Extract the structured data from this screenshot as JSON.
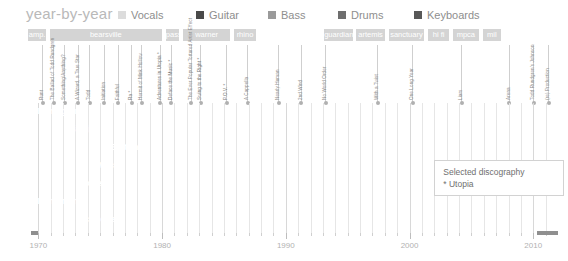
{
  "header": {
    "title": "year-by-year",
    "legend": [
      {
        "label": "Vocals",
        "color": "#dcdcdc"
      },
      {
        "label": "Guitar",
        "color": "#4a4a4a"
      },
      {
        "label": "Bass",
        "color": "#9a9a9a"
      },
      {
        "label": "Drums",
        "color": "#6e6e6e"
      },
      {
        "label": "Keyboards",
        "color": "#585858"
      }
    ]
  },
  "annotation": {
    "line1": "Selected discography",
    "line2": "* Utopia"
  },
  "chart_data": {
    "type": "bar",
    "title": "year-by-year",
    "xlabel": "",
    "ylabel": "",
    "xlim": [
      1969.0,
      2012.0
    ],
    "grid": true,
    "legend_position": "top",
    "tick_labels": [
      "1970",
      "1980",
      "1990",
      "2000",
      "2010"
    ],
    "tick_years": [
      1970,
      1980,
      1990,
      2000,
      2010
    ],
    "record_labels": [
      {
        "name": "amp.",
        "start": 1969.2,
        "end": 1970.6
      },
      {
        "name": "bearsville",
        "start": 1970.9,
        "end": 1980.0
      },
      {
        "name": "pass",
        "start": 1980.3,
        "end": 1981.4
      },
      {
        "name": "warner",
        "start": 1981.7,
        "end": 1985.5
      },
      {
        "name": "rhino",
        "start": 1985.8,
        "end": 1987.6
      },
      {
        "name": "guardian",
        "start": 1993.1,
        "end": 1995.4
      },
      {
        "name": "artemis",
        "start": 1995.7,
        "end": 1998.0
      },
      {
        "name": "sanctuary",
        "start": 1998.3,
        "end": 2001.2
      },
      {
        "name": "hi fi",
        "start": 2001.5,
        "end": 2003.2
      },
      {
        "name": "mpca",
        "start": 2003.5,
        "end": 2005.6
      },
      {
        "name": "mil",
        "start": 2005.9,
        "end": 2007.4
      }
    ],
    "albums": [
      {
        "title": "Runt",
        "year": 1970.3,
        "utopia": false
      },
      {
        "title": "The Ballad of Todd Rundgren",
        "year": 1971.2,
        "utopia": false
      },
      {
        "title": "Something/Anything?",
        "year": 1972.1,
        "utopia": false
      },
      {
        "title": "A Wizard, a True Star",
        "year": 1973.2,
        "utopia": false
      },
      {
        "title": "Todd",
        "year": 1974.1,
        "utopia": false
      },
      {
        "title": "Initiation",
        "year": 1975.3,
        "utopia": false
      },
      {
        "title": "Faithful",
        "year": 1976.4,
        "utopia": false
      },
      {
        "title": "Ra *",
        "year": 1977.5,
        "utopia": true
      },
      {
        "title": "Hermit of Mink Hollow",
        "year": 1978.3,
        "utopia": false
      },
      {
        "title": "Adventures in Utopia *",
        "year": 1979.8,
        "utopia": true
      },
      {
        "title": "Deface the Music *",
        "year": 1980.7,
        "utopia": true
      },
      {
        "title": "The Ever Popular Tortured Artist Effect",
        "year": 1982.3,
        "utopia": false
      },
      {
        "title": "Swing to the Right *",
        "year": 1983.1,
        "utopia": true
      },
      {
        "title": "P.O.V. *",
        "year": 1985.2,
        "utopia": true
      },
      {
        "title": "A Cappella",
        "year": 1986.9,
        "utopia": false
      },
      {
        "title": "Nearly Human",
        "year": 1989.4,
        "utopia": false
      },
      {
        "title": "2nd Wind",
        "year": 1991.2,
        "utopia": false
      },
      {
        "title": "No World Order",
        "year": 1993.2,
        "utopia": false
      },
      {
        "title": "With a Twist",
        "year": 1997.4,
        "utopia": false
      },
      {
        "title": "One Long Year",
        "year": 2000.2,
        "utopia": false
      },
      {
        "title": "Liars",
        "year": 2004.2,
        "utopia": false
      },
      {
        "title": "Arena",
        "year": 2008.0,
        "utopia": false
      },
      {
        "title": "Todd Rundgren's Johnson",
        "year": 2010.0,
        "utopia": false
      },
      {
        "title": "(re) Production",
        "year": 2011.2,
        "utopia": false
      }
    ],
    "members": [
      {
        "name": "Rundgren",
        "label_end": 1973.0,
        "segments": [
          {
            "start": 1969.6,
            "end": 2012.0,
            "color": "#6b6b6b",
            "style": "solid"
          }
        ]
      },
      {
        "name": "Siegler",
        "label_start": 1972.2,
        "label_end": 1975.6,
        "segments": [
          {
            "start": 1972.2,
            "end": 1975.6,
            "color": "#9a9a9a",
            "style": "solid"
          },
          {
            "start": 1975.6,
            "end": 2010.3,
            "color": "#9a9a9a",
            "style": "hatch"
          },
          {
            "start": 2010.3,
            "end": 2012.0,
            "color": "#9a9a9a",
            "style": "solid"
          }
        ]
      },
      {
        "name": "Sulton",
        "label_start": 1975.5,
        "label_end": 1978.2,
        "segments": [
          {
            "start": 1975.5,
            "end": 1986.0,
            "color": "#8a8a8a",
            "style": "solid"
          },
          {
            "start": 1986.0,
            "end": 1988.4,
            "color": "#8a8a8a",
            "style": "hatch"
          },
          {
            "start": 1988.4,
            "end": 1990.4,
            "color": "#8a8a8a",
            "style": "solid"
          },
          {
            "start": 1990.4,
            "end": 2010.3,
            "color": "#8a8a8a",
            "style": "hatch"
          },
          {
            "start": 2010.3,
            "end": 2012.0,
            "color": "#8a8a8a",
            "style": "solid"
          }
        ]
      },
      {
        "name": "Wilcox",
        "label_start": 1974.3,
        "label_end": 1977.2,
        "segments": [
          {
            "start": 1974.3,
            "end": 1986.0,
            "color": "#6e6e6e",
            "style": "solid"
          },
          {
            "start": 1986.0,
            "end": 1988.1,
            "color": "#6e6e6e",
            "style": "hatch"
          },
          {
            "start": 1988.1,
            "end": 1989.9,
            "color": "#6e6e6e",
            "style": "solid"
          },
          {
            "start": 1989.9,
            "end": 1992.6,
            "color": "#6e6e6e",
            "style": "hatch"
          }
        ]
      },
      {
        "name": "Powell",
        "label_start": 1972.9,
        "label_end": 1975.7,
        "segments": [
          {
            "start": 1972.9,
            "end": 1986.0,
            "color": "#6e6e6e",
            "style": "solid"
          },
          {
            "start": 1986.0,
            "end": 1988.0,
            "color": "#6e6e6e",
            "style": "hatch"
          },
          {
            "start": 1988.0,
            "end": 1990.0,
            "color": "#6e6e6e",
            "style": "solid"
          }
        ]
      },
      {
        "name": "Klingman",
        "label_start": 1969.6,
        "label_end": 1972.6,
        "segments": [
          {
            "start": 1969.6,
            "end": 1974.8,
            "color": "#6b6b6b",
            "style": "solid"
          },
          {
            "start": 1974.8,
            "end": 2010.3,
            "color": "#6b6b6b",
            "style": "hatch"
          },
          {
            "start": 2010.3,
            "end": 2012.0,
            "color": "#6b6b6b",
            "style": "solid"
          }
        ]
      },
      {
        "name": "Schuckett",
        "label_start": 1972.9,
        "label_end": 1975.6,
        "segments": [
          {
            "start": 1972.9,
            "end": 1975.0,
            "color": "#6b6b6b",
            "style": "solid"
          },
          {
            "start": 1975.0,
            "end": 2010.3,
            "color": "#6b6b6b",
            "style": "hatch"
          },
          {
            "start": 2010.3,
            "end": 2012.0,
            "color": "#6b6b6b",
            "style": "solid"
          }
        ]
      }
    ]
  }
}
